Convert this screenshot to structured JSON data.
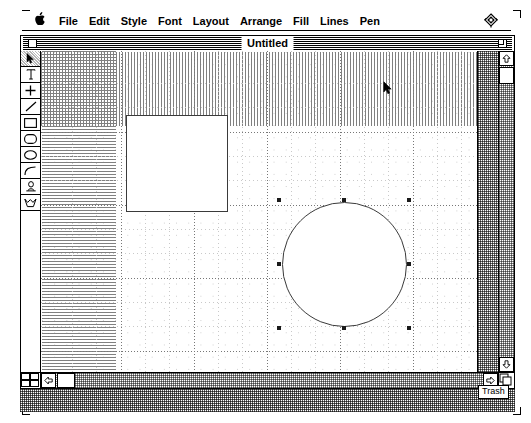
{
  "app": {
    "name": "MacDraw",
    "platform": "Macintosh System Software"
  },
  "menubar": {
    "apple_label": "\u0001",
    "items": [
      {
        "label": "File",
        "name": "menu-file"
      },
      {
        "label": "Edit",
        "name": "menu-edit"
      },
      {
        "label": "Style",
        "name": "menu-style"
      },
      {
        "label": "Font",
        "name": "menu-font"
      },
      {
        "label": "Layout",
        "name": "menu-layout"
      },
      {
        "label": "Arrange",
        "name": "menu-arrange"
      },
      {
        "label": "Fill",
        "name": "menu-fill"
      },
      {
        "label": "Lines",
        "name": "menu-lines"
      },
      {
        "label": "Pen",
        "name": "menu-pen"
      }
    ],
    "right_icon": "application-switcher-icon"
  },
  "window": {
    "title": "Untitled",
    "close_box": "close-box",
    "zoom_box": "zoom-box"
  },
  "tools": [
    {
      "name": "tool-pointer",
      "icon": "arrow-icon",
      "selected": true
    },
    {
      "name": "tool-text",
      "icon": "text-icon",
      "selected": false
    },
    {
      "name": "tool-crosshair",
      "icon": "crosshair-icon",
      "selected": false
    },
    {
      "name": "tool-line",
      "icon": "line-icon",
      "selected": false
    },
    {
      "name": "tool-rectangle",
      "icon": "rectangle-icon",
      "selected": false
    },
    {
      "name": "tool-rounded-rectangle",
      "icon": "rounded-rectangle-icon",
      "selected": false
    },
    {
      "name": "tool-oval",
      "icon": "oval-icon",
      "selected": false
    },
    {
      "name": "tool-arc",
      "icon": "arc-icon",
      "selected": false
    },
    {
      "name": "tool-freehand",
      "icon": "freehand-icon",
      "selected": false
    },
    {
      "name": "tool-polygon",
      "icon": "polygon-icon",
      "selected": false
    }
  ],
  "canvas": {
    "grid_visible": true,
    "shapes": [
      {
        "name": "shape-square",
        "type": "rectangle",
        "x": 85,
        "y": 64,
        "width": 102,
        "height": 97,
        "fill": "#ffffff",
        "stroke": "#3a3a3a",
        "selected": false
      },
      {
        "name": "shape-circle",
        "type": "oval",
        "x": 241,
        "y": 151,
        "width": 125,
        "height": 125,
        "fill": "#ffffff",
        "stroke": "#3a3a3a",
        "selected": true,
        "handle_count": 8
      }
    ]
  },
  "scrollbars": {
    "vertical": {
      "up_arrow": "scroll-up-arrow",
      "down_arrow": "scroll-down-arrow",
      "thumb_position": "top"
    },
    "horizontal": {
      "left_arrow": "scroll-left-arrow",
      "right_arrow": "scroll-right-arrow",
      "thumb_position": "left"
    }
  },
  "desktop": {
    "trash_label": "Trash"
  },
  "cursor": {
    "type": "arrow-pointer",
    "x": 385,
    "y": 85
  },
  "colors": {
    "ink": "#000000",
    "paper": "#ffffff",
    "grid_major": "#777777",
    "grid_minor": "#c9c9c9",
    "shape_stroke": "#3a3a3a",
    "desktop_pattern": "#5a5a5a"
  }
}
